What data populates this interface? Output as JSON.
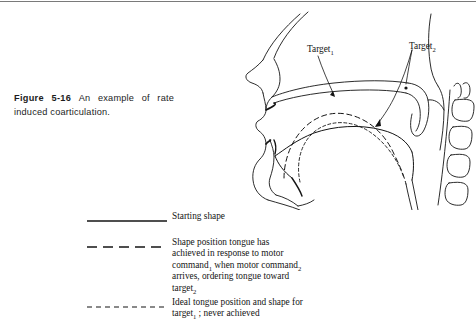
{
  "figure": {
    "number": "Figure 5-16",
    "caption": "An example of rate induced coarticulation."
  },
  "diagram": {
    "annotations": [
      {
        "id": "target1",
        "text": "Target",
        "subscript": "1"
      },
      {
        "id": "target2",
        "text": "Target",
        "subscript": "2"
      }
    ],
    "structures": [
      "nasal-profile",
      "hard-palate",
      "velum",
      "uvula",
      "upper-lip",
      "lower-lip",
      "mandible",
      "hyoid",
      "epiglottis",
      "larynx",
      "pharyngeal-wall",
      "cervical-vertebrae"
    ]
  },
  "legend": {
    "items": [
      {
        "style": "solid",
        "lines": [
          {
            "text": "Starting shape",
            "sub": "",
            "tail": ""
          }
        ]
      },
      {
        "style": "long-dash",
        "lines": [
          {
            "text": "Shape position tongue has",
            "sub": "",
            "tail": ""
          },
          {
            "text": "achieved in response to motor",
            "sub": "",
            "tail": ""
          },
          {
            "text": "command",
            "sub": "1",
            "tail": " when motor command"
          },
          {
            "text": "",
            "sub": "2",
            "tail": ""
          },
          {
            "text": "arrives, ordering tongue toward",
            "sub": "",
            "tail": ""
          },
          {
            "text": "target",
            "sub": "2",
            "tail": ""
          }
        ]
      },
      {
        "style": "short-dash",
        "lines": [
          {
            "text": "Ideal tongue position and shape for",
            "sub": "",
            "tail": ""
          },
          {
            "text": "target",
            "sub": "1",
            "tail": " ; never achieved"
          }
        ]
      }
    ]
  },
  "colors": {
    "ink": "#141414",
    "rule": "#7a7a7a",
    "paper": "#ffffff"
  }
}
